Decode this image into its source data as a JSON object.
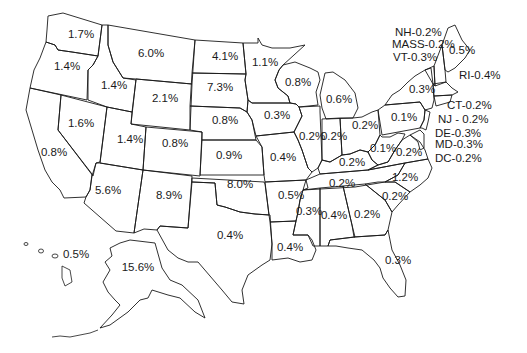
{
  "map": {
    "title": "",
    "type": "us-state-choropleth-labels",
    "stroke_color": "#1a1a1a",
    "background": "#ffffff"
  },
  "chart_data": {
    "type": "map",
    "title": "",
    "unit": "%",
    "states": [
      {
        "state": "Washington",
        "abbr": "WA",
        "label": "1.7%",
        "value": 1.7,
        "x": 81,
        "y": 35
      },
      {
        "state": "Oregon",
        "abbr": "OR",
        "label": "1.4%",
        "value": 1.4,
        "x": 67,
        "y": 67
      },
      {
        "state": "Idaho",
        "abbr": "ID",
        "label": "1.4%",
        "value": 1.4,
        "x": 114,
        "y": 86
      },
      {
        "state": "Montana",
        "abbr": "MT",
        "label": "6.0%",
        "value": 6.0,
        "x": 151,
        "y": 54
      },
      {
        "state": "Wyoming",
        "abbr": "WY",
        "label": "2.1%",
        "value": 2.1,
        "x": 165,
        "y": 99
      },
      {
        "state": "North Dakota",
        "abbr": "ND",
        "label": "4.1%",
        "value": 4.1,
        "x": 225,
        "y": 57
      },
      {
        "state": "South Dakota",
        "abbr": "SD",
        "label": "7.3%",
        "value": 7.3,
        "x": 220,
        "y": 88
      },
      {
        "state": "Minnesota",
        "abbr": "MN",
        "label": "1.1%",
        "value": 1.1,
        "x": 265,
        "y": 63
      },
      {
        "state": "Wisconsin",
        "abbr": "WI",
        "label": "0.8%",
        "value": 0.8,
        "x": 298,
        "y": 83
      },
      {
        "state": "Michigan",
        "abbr": "MI",
        "label": "0.6%",
        "value": 0.6,
        "x": 339,
        "y": 100
      },
      {
        "state": "Nevada",
        "abbr": "NV",
        "label": "1.6%",
        "value": 1.6,
        "x": 81,
        "y": 124
      },
      {
        "state": "California",
        "abbr": "CA",
        "label": "0.8%",
        "value": 0.8,
        "x": 54,
        "y": 153
      },
      {
        "state": "Utah",
        "abbr": "UT",
        "label": "1.4%",
        "value": 1.4,
        "x": 130,
        "y": 140
      },
      {
        "state": "Colorado",
        "abbr": "CO",
        "label": "0.8%",
        "value": 0.8,
        "x": 175,
        "y": 144
      },
      {
        "state": "Nebraska",
        "abbr": "NE",
        "label": "0.8%",
        "value": 0.8,
        "x": 225,
        "y": 121
      },
      {
        "state": "Iowa",
        "abbr": "IA",
        "label": "0.3%",
        "value": 0.3,
        "x": 277,
        "y": 116
      },
      {
        "state": "Illinois",
        "abbr": "IL",
        "label": "0.2%",
        "value": 0.2,
        "x": 312,
        "y": 137
      },
      {
        "state": "Indiana",
        "abbr": "IN",
        "label": "0.2%",
        "value": 0.2,
        "x": 334,
        "y": 137
      },
      {
        "state": "Ohio",
        "abbr": "OH",
        "label": "0.2%",
        "value": 0.2,
        "x": 365,
        "y": 126
      },
      {
        "state": "Pennsylvania",
        "abbr": "PA",
        "label": "0.1%",
        "value": 0.1,
        "x": 404,
        "y": 118
      },
      {
        "state": "New York",
        "abbr": "NY",
        "label": "0.3%",
        "value": 0.3,
        "x": 422,
        "y": 90
      },
      {
        "state": "Maine",
        "abbr": "ME",
        "label": "0.5%",
        "value": 0.5,
        "x": 462,
        "y": 51
      },
      {
        "state": "Kansas",
        "abbr": "KS",
        "label": "0.9%",
        "value": 0.9,
        "x": 229,
        "y": 156
      },
      {
        "state": "Missouri",
        "abbr": "MO",
        "label": "0.4%",
        "value": 0.4,
        "x": 283,
        "y": 158
      },
      {
        "state": "Kentucky",
        "abbr": "KY",
        "label": "0.2%",
        "value": 0.2,
        "x": 352,
        "y": 163
      },
      {
        "state": "West Virginia",
        "abbr": "WV",
        "label": "0.1%",
        "value": 0.1,
        "x": 383,
        "y": 149
      },
      {
        "state": "Virginia",
        "abbr": "VA",
        "label": "0.2%",
        "value": 0.2,
        "x": 409,
        "y": 153
      },
      {
        "state": "Arizona",
        "abbr": "AZ",
        "label": "5.6%",
        "value": 5.6,
        "x": 108,
        "y": 191
      },
      {
        "state": "New Mexico",
        "abbr": "NM",
        "label": "8.9%",
        "value": 8.9,
        "x": 169,
        "y": 196
      },
      {
        "state": "Oklahoma",
        "abbr": "OK",
        "label": "8.0%",
        "value": 8.0,
        "x": 240,
        "y": 185
      },
      {
        "state": "Arkansas",
        "abbr": "AR",
        "label": "0.5%",
        "value": 0.5,
        "x": 291,
        "y": 196
      },
      {
        "state": "Tennessee",
        "abbr": "TN",
        "label": "0.2%",
        "value": 0.2,
        "x": 342,
        "y": 184
      },
      {
        "state": "North Carolina",
        "abbr": "NC",
        "label": "1.2%",
        "value": 1.2,
        "x": 405,
        "y": 178
      },
      {
        "state": "South Carolina",
        "abbr": "SC",
        "label": "0.2%",
        "value": 0.2,
        "x": 395,
        "y": 197
      },
      {
        "state": "Mississippi",
        "abbr": "MS",
        "label": "0.3%",
        "value": 0.3,
        "x": 309,
        "y": 212
      },
      {
        "state": "Alabama",
        "abbr": "AL",
        "label": "0.4%",
        "value": 0.4,
        "x": 334,
        "y": 216
      },
      {
        "state": "Georgia",
        "abbr": "GA",
        "label": "0.2%",
        "value": 0.2,
        "x": 367,
        "y": 215
      },
      {
        "state": "Texas",
        "abbr": "TX",
        "label": "0.4%",
        "value": 0.4,
        "x": 230,
        "y": 236
      },
      {
        "state": "Louisiana",
        "abbr": "LA",
        "label": "0.4%",
        "value": 0.4,
        "x": 290,
        "y": 248
      },
      {
        "state": "Florida",
        "abbr": "FL",
        "label": "0.3%",
        "value": 0.3,
        "x": 398,
        "y": 261
      },
      {
        "state": "Hawaii",
        "abbr": "HI",
        "label": "0.5%",
        "value": 0.5,
        "x": 76,
        "y": 255
      },
      {
        "state": "Alaska",
        "abbr": "AK",
        "label": "15.6%",
        "value": 15.6,
        "x": 138,
        "y": 268
      }
    ],
    "callouts": [
      {
        "state": "New Hampshire",
        "abbr": "NH",
        "label": "NH-0.2%",
        "value": 0.2,
        "x": 395,
        "y": 33
      },
      {
        "state": "Massachusetts",
        "abbr": "MA",
        "label": "MASS-0.2%",
        "value": 0.2,
        "x": 392,
        "y": 45
      },
      {
        "state": "Vermont",
        "abbr": "VT",
        "label": "VT-0.3%",
        "value": 0.3,
        "x": 393,
        "y": 58
      },
      {
        "state": "Rhode Island",
        "abbr": "RI",
        "label": "RI-0.4%",
        "value": 0.4,
        "x": 459,
        "y": 76
      },
      {
        "state": "Connecticut",
        "abbr": "CT",
        "label": "CT-0.2%",
        "value": 0.2,
        "x": 447,
        "y": 106
      },
      {
        "state": "New Jersey",
        "abbr": "NJ",
        "label": "NJ - 0.2%",
        "value": 0.2,
        "x": 438,
        "y": 120
      },
      {
        "state": "Delaware",
        "abbr": "DE",
        "label": "DE-0.3%",
        "value": 0.3,
        "x": 435,
        "y": 134
      },
      {
        "state": "Maryland",
        "abbr": "MD",
        "label": "MD-0.3%",
        "value": 0.3,
        "x": 435,
        "y": 145
      },
      {
        "state": "District of Columbia",
        "abbr": "DC",
        "label": "DC-0.2%",
        "value": 0.2,
        "x": 435,
        "y": 159
      }
    ]
  }
}
